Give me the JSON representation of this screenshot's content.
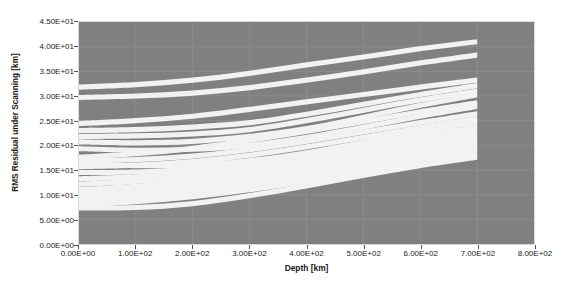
{
  "chart_data": {
    "type": "line",
    "title": "",
    "subtitle": "",
    "xlabel": "Depth [km]",
    "ylabel": "RMS Residual under Scanning [km]",
    "xlim": [
      0,
      800
    ],
    "ylim": [
      0,
      45
    ],
    "xticks": [
      "0.00E+00",
      "1.00E+02",
      "2.00E+02",
      "3.00E+02",
      "4.00E+02",
      "5.00E+02",
      "6.00E+02",
      "7.00E+02",
      "8.00E+02"
    ],
    "xtick_values": [
      0,
      100,
      200,
      300,
      400,
      500,
      600,
      700,
      800
    ],
    "yticks": [
      "0.00E+00",
      "5.00E+00",
      "1.00E+01",
      "1.50E+01",
      "2.00E+01",
      "2.50E+01",
      "3.00E+01",
      "3.50E+01",
      "4.00E+01",
      "4.50E+01"
    ],
    "ytick_values": [
      0,
      5,
      10,
      15,
      20,
      25,
      30,
      35,
      40,
      45
    ],
    "grid": true,
    "legend_position": "none",
    "plot_background": "#808080",
    "series_color": "#f2f2f2",
    "x_data": [
      0,
      100,
      200,
      300,
      400,
      500,
      600,
      700
    ],
    "series": [
      {
        "name": "curve-01",
        "values": [
          31.8,
          32.3,
          33.2,
          34.6,
          36.3,
          37.9,
          39.6,
          41.0
        ]
      },
      {
        "name": "curve-02",
        "values": [
          29.7,
          30.0,
          30.6,
          31.7,
          33.2,
          34.9,
          36.7,
          38.3
        ]
      },
      {
        "name": "curve-03",
        "values": [
          24.4,
          25.0,
          25.9,
          27.3,
          28.8,
          30.3,
          31.8,
          33.2
        ]
      },
      {
        "name": "curve-04",
        "values": [
          23.0,
          23.2,
          23.7,
          24.6,
          26.3,
          28.3,
          30.3,
          32.1
        ]
      },
      {
        "name": "curve-05",
        "values": [
          21.8,
          21.9,
          22.3,
          23.2,
          25.0,
          27.1,
          29.2,
          31.0
        ]
      },
      {
        "name": "curve-06",
        "values": [
          20.7,
          20.5,
          20.8,
          21.8,
          23.4,
          25.7,
          28.1,
          30.2
        ]
      },
      {
        "name": "curve-07",
        "values": [
          17.6,
          18.3,
          19.4,
          21.0,
          22.8,
          24.8,
          26.8,
          28.6
        ]
      },
      {
        "name": "curve-08",
        "values": [
          19.3,
          19.0,
          19.2,
          20.0,
          21.6,
          23.7,
          25.9,
          27.9
        ]
      },
      {
        "name": "curve-09",
        "values": [
          16.9,
          17.1,
          17.8,
          19.1,
          20.8,
          22.7,
          24.6,
          26.4
        ]
      },
      {
        "name": "curve-10",
        "values": [
          15.7,
          16.0,
          16.7,
          18.0,
          19.7,
          21.6,
          23.6,
          25.4
        ]
      },
      {
        "name": "curve-11",
        "values": [
          16.3,
          15.9,
          16.0,
          16.9,
          18.5,
          20.6,
          22.8,
          24.7
        ]
      },
      {
        "name": "curve-12",
        "values": [
          14.5,
          14.6,
          15.2,
          16.4,
          18.0,
          19.9,
          21.9,
          23.7
        ]
      },
      {
        "name": "curve-13",
        "values": [
          13.2,
          13.6,
          14.4,
          15.7,
          17.3,
          19.2,
          21.1,
          22.9
        ]
      },
      {
        "name": "curve-14",
        "values": [
          12.1,
          12.7,
          13.6,
          14.9,
          16.5,
          18.4,
          20.3,
          22.0
        ]
      },
      {
        "name": "curve-15",
        "values": [
          11.0,
          11.7,
          12.7,
          14.1,
          15.8,
          17.6,
          19.5,
          21.2
        ]
      },
      {
        "name": "curve-16",
        "values": [
          10.2,
          10.8,
          11.8,
          13.2,
          14.9,
          16.8,
          18.7,
          20.4
        ]
      },
      {
        "name": "curve-17",
        "values": [
          9.4,
          10.0,
          11.0,
          12.4,
          14.1,
          16.0,
          17.9,
          19.6
        ]
      },
      {
        "name": "curve-18",
        "values": [
          8.6,
          9.3,
          10.3,
          11.7,
          13.4,
          15.3,
          17.2,
          18.9
        ]
      },
      {
        "name": "curve-19",
        "values": [
          7.9,
          8.6,
          9.6,
          11.0,
          12.7,
          14.6,
          16.5,
          18.2
        ]
      },
      {
        "name": "curve-20",
        "values": [
          7.3,
          7.4,
          8.2,
          9.8,
          11.8,
          13.9,
          15.9,
          17.6
        ]
      }
    ],
    "band_thickness": 1.05
  }
}
